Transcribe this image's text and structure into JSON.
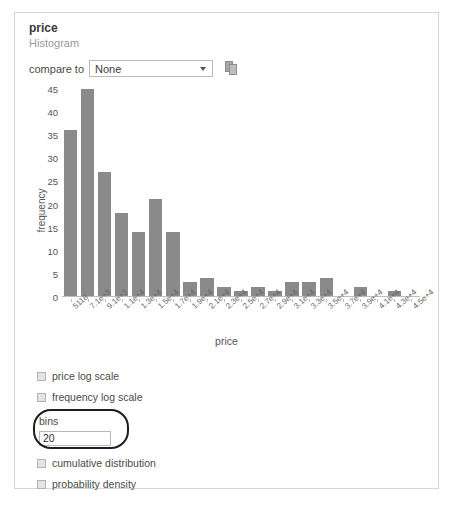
{
  "card": {
    "title": "price",
    "subtitle": "Histogram"
  },
  "compare": {
    "label": "compare to",
    "selected": "None",
    "options": [
      "None"
    ],
    "dropdown_icon": "chevron-down-icon",
    "copy_icon": "copy-icon"
  },
  "options": {
    "price_log_scale": "price log scale",
    "frequency_log_scale": "frequency log scale",
    "bins_label": "bins",
    "bins_value": "20",
    "cumulative_distribution": "cumulative distribution",
    "probability_density": "probability density"
  },
  "colors": {
    "bar": "#8a8a8a",
    "axis": "#bdbdbd",
    "card_border": "#d6d6d6",
    "highlight": "#1d1d1d"
  },
  "chart_data": {
    "type": "bar",
    "title": "",
    "xlabel": "price",
    "ylabel": "frequency",
    "ylim": [
      0,
      45
    ],
    "yticks": [
      0,
      5,
      10,
      15,
      20,
      25,
      30,
      35,
      40,
      45
    ],
    "grid": false,
    "legend": false,
    "categories": [
      "5118",
      "7.1e+3",
      "9.1e+3",
      "1.1e+4",
      "1.3e+4",
      "1.5e+4",
      "1.7e+4",
      "1.9e+4",
      "2.1e+4",
      "2.3e+4",
      "2.5e+4",
      "2.7e+4",
      "2.9e+4",
      "3.1e+4",
      "3.3e+4",
      "3.5e+4",
      "3.7e+4",
      "3.9e+4",
      "4.1e+4",
      "4.3e+4",
      "4.5e+4"
    ],
    "values": [
      36,
      45,
      27,
      18,
      14,
      21,
      14,
      3,
      4,
      2,
      1,
      2,
      1,
      3,
      3,
      4,
      0,
      2,
      0,
      1,
      0
    ]
  }
}
